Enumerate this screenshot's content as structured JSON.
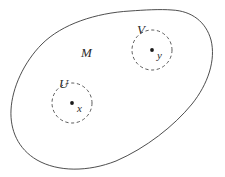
{
  "figure": {
    "background_color": "#ffffff",
    "outline_color": "#3a3a3a",
    "dashed_color": "#4a4a4a",
    "point_color": "#1a1a1a",
    "manifold": {
      "label": "M",
      "label_x": 81,
      "label_y": 57
    },
    "neighborhoods": [
      {
        "label": "U",
        "label_x": 59,
        "label_y": 88,
        "center_x": 72,
        "center_y": 103,
        "radius": 20,
        "point_label": "x",
        "point_label_x": 77,
        "point_label_y": 112
      },
      {
        "label": "V",
        "label_x": 137,
        "label_y": 34,
        "center_x": 152,
        "center_y": 50,
        "radius": 20,
        "point_label": "y",
        "point_label_x": 157,
        "point_label_y": 59
      }
    ]
  }
}
